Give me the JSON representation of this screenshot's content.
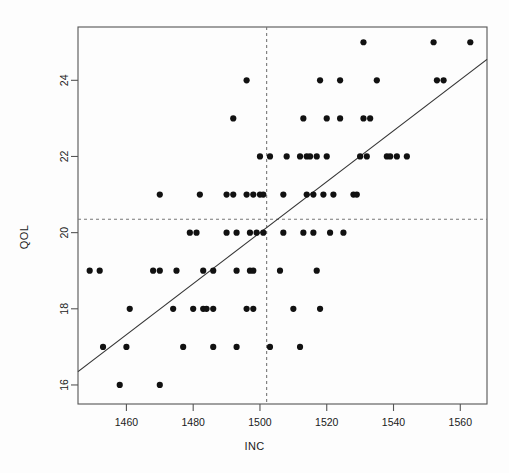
{
  "chart_data": {
    "type": "scatter",
    "title": "",
    "xlabel": "INC",
    "ylabel": "QOL",
    "xlim": [
      1445.5,
      1568.0
    ],
    "ylim": [
      15.5,
      25.4
    ],
    "xticks": [
      1460,
      1480,
      1500,
      1520,
      1540,
      1560
    ],
    "yticks": [
      16,
      18,
      20,
      22,
      24
    ],
    "grid": false,
    "legend": null,
    "annotations": {
      "mean_lines": {
        "style": "dashed",
        "x_mean": 1502,
        "y_mean": 20.35
      },
      "regression_line": {
        "style": "solid",
        "x_start": 1445.5,
        "y_start": 16.35,
        "x_end": 1568.0,
        "y_end": 24.55
      }
    },
    "points": [
      [
        1531,
        25
      ],
      [
        1552,
        25
      ],
      [
        1563,
        25
      ],
      [
        1496,
        24
      ],
      [
        1518,
        24
      ],
      [
        1524,
        24
      ],
      [
        1535,
        24
      ],
      [
        1553,
        24
      ],
      [
        1555,
        24
      ],
      [
        1492,
        23
      ],
      [
        1513,
        23
      ],
      [
        1520,
        23
      ],
      [
        1524,
        23
      ],
      [
        1531,
        23
      ],
      [
        1533,
        23
      ],
      [
        1500,
        22
      ],
      [
        1503,
        22
      ],
      [
        1508,
        22
      ],
      [
        1512,
        22
      ],
      [
        1514,
        22
      ],
      [
        1515,
        22
      ],
      [
        1517,
        22
      ],
      [
        1520,
        22
      ],
      [
        1530,
        22
      ],
      [
        1532,
        22
      ],
      [
        1538,
        22
      ],
      [
        1539,
        22
      ],
      [
        1541,
        22
      ],
      [
        1544,
        22
      ],
      [
        1470,
        21
      ],
      [
        1482,
        21
      ],
      [
        1490,
        21
      ],
      [
        1492,
        21
      ],
      [
        1496,
        21
      ],
      [
        1498,
        21
      ],
      [
        1500,
        21
      ],
      [
        1501,
        21
      ],
      [
        1507,
        21
      ],
      [
        1514,
        21
      ],
      [
        1516,
        21
      ],
      [
        1519,
        21
      ],
      [
        1522,
        21
      ],
      [
        1528,
        21
      ],
      [
        1529,
        21
      ],
      [
        1479,
        20
      ],
      [
        1481,
        20
      ],
      [
        1490,
        20
      ],
      [
        1493,
        20
      ],
      [
        1497,
        20
      ],
      [
        1499,
        20
      ],
      [
        1501,
        20
      ],
      [
        1507,
        20
      ],
      [
        1513,
        20
      ],
      [
        1516,
        20
      ],
      [
        1521,
        20
      ],
      [
        1525,
        20
      ],
      [
        1449,
        19
      ],
      [
        1452,
        19
      ],
      [
        1468,
        19
      ],
      [
        1470,
        19
      ],
      [
        1475,
        19
      ],
      [
        1483,
        19
      ],
      [
        1486,
        19
      ],
      [
        1493,
        19
      ],
      [
        1497,
        19
      ],
      [
        1498,
        19
      ],
      [
        1506,
        19
      ],
      [
        1517,
        19
      ],
      [
        1461,
        18
      ],
      [
        1474,
        18
      ],
      [
        1480,
        18
      ],
      [
        1483,
        18
      ],
      [
        1484,
        18
      ],
      [
        1486,
        18
      ],
      [
        1496,
        18
      ],
      [
        1498,
        18
      ],
      [
        1510,
        18
      ],
      [
        1518,
        18
      ],
      [
        1453,
        17
      ],
      [
        1460,
        17
      ],
      [
        1477,
        17
      ],
      [
        1486,
        17
      ],
      [
        1493,
        17
      ],
      [
        1503,
        17
      ],
      [
        1512,
        17
      ],
      [
        1458,
        16
      ],
      [
        1470,
        16
      ]
    ]
  },
  "style": {
    "point_color": "#111111",
    "axis_color": "#555555",
    "line_color": "#333333",
    "dash_color": "#777777",
    "background": "#fdfdfd",
    "point_radius": 3.1
  }
}
